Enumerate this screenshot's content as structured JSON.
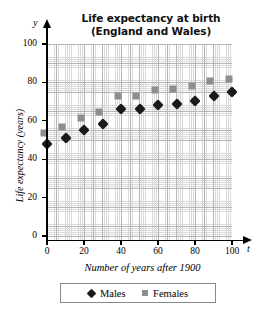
{
  "chart_data": {
    "type": "scatter",
    "title": "Life expectancy at birth (England and Wales)",
    "title_line1": "Life expectancy at birth",
    "title_line2": "(England and Wales)",
    "xlabel": "Number of years after 1900",
    "ylabel": "Life expectancy (years)",
    "x_variable": "t",
    "y_variable": "y",
    "x": [
      0,
      10,
      20,
      30,
      40,
      50,
      60,
      70,
      80,
      90,
      100
    ],
    "xlim": [
      0,
      100
    ],
    "ylim": [
      0,
      100
    ],
    "xticks": [
      0,
      20,
      40,
      60,
      80,
      100
    ],
    "yticks": [
      0,
      20,
      40,
      60,
      80,
      100
    ],
    "grid": true,
    "legend_position": "bottom",
    "series": [
      {
        "name": "Males",
        "marker": "diamond",
        "color": "#1a1a1a",
        "values": [
          48,
          51,
          55,
          58.5,
          66,
          66,
          68,
          68.5,
          70.5,
          73,
          75
        ]
      },
      {
        "name": "Females",
        "marker": "square",
        "color": "#8e8e8e",
        "values": [
          52,
          55,
          59.5,
          63,
          71,
          71,
          74,
          75,
          76.5,
          79,
          80
        ]
      }
    ]
  },
  "legend": {
    "items": [
      {
        "label": "Males",
        "marker": "diamond",
        "color": "#1a1a1a"
      },
      {
        "label": "Females",
        "marker": "square",
        "color": "#8e8e8e"
      }
    ]
  }
}
